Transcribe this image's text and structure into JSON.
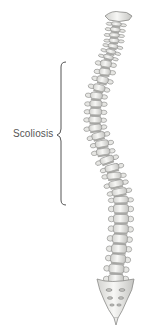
{
  "diagram": {
    "annotation": {
      "label": "Scoliosis",
      "bracket": "curly-brace"
    },
    "colors": {
      "bone": "#f4f4f2",
      "bone_shadow": "#c9c9c6",
      "outline": "#8a8a88",
      "disc": "#a8a8a5",
      "text": "#555555"
    }
  }
}
